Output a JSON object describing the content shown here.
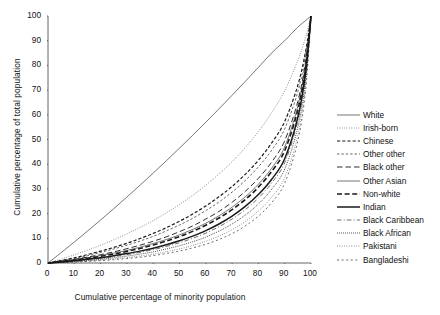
{
  "chart_data": {
    "type": "line",
    "title": "",
    "xlabel": "Cumulative percentage of minority population",
    "ylabel": "Cumulative percentage of total population",
    "xlim": [
      0,
      100
    ],
    "ylim": [
      0,
      100
    ],
    "xticks": [
      0,
      10,
      20,
      30,
      40,
      50,
      60,
      70,
      80,
      90,
      100
    ],
    "yticks": [
      0,
      10,
      20,
      30,
      40,
      50,
      60,
      70,
      80,
      90,
      100
    ],
    "grid": false,
    "legend_position": "right",
    "x": [
      0,
      5,
      10,
      15,
      20,
      25,
      30,
      35,
      40,
      45,
      50,
      55,
      60,
      65,
      70,
      75,
      80,
      85,
      90,
      95,
      98,
      100
    ],
    "series": [
      {
        "name": "White",
        "style": "solid-thin",
        "values": [
          0,
          4.2,
          8.5,
          12.9,
          17.4,
          22.0,
          26.7,
          31.5,
          36.4,
          41.4,
          46.5,
          51.7,
          57.0,
          62.4,
          67.9,
          73.5,
          79.2,
          85.0,
          90.0,
          95.5,
          98.2,
          100
        ]
      },
      {
        "name": "Irish-born",
        "style": "dotted-fine",
        "values": [
          0,
          1.6,
          3.3,
          5.2,
          7.2,
          9.4,
          11.8,
          14.4,
          17.2,
          20.3,
          23.7,
          27.4,
          31.5,
          36.0,
          41.0,
          46.7,
          53.2,
          60.8,
          69.8,
          82.0,
          91.5,
          100
        ]
      },
      {
        "name": "Chinese",
        "style": "dashed-med",
        "values": [
          0,
          1.0,
          2.1,
          3.4,
          4.8,
          6.3,
          8.0,
          9.9,
          12.0,
          14.3,
          16.9,
          19.8,
          23.1,
          26.8,
          31.0,
          35.9,
          41.6,
          48.5,
          57.3,
          72.0,
          86.0,
          100
        ]
      },
      {
        "name": "Other other",
        "style": "dashed-fine",
        "values": [
          0,
          0.9,
          1.9,
          3.0,
          4.3,
          5.7,
          7.2,
          8.9,
          10.8,
          13.0,
          15.4,
          18.1,
          21.2,
          24.7,
          28.7,
          33.4,
          38.9,
          45.6,
          54.3,
          69.4,
          84.5,
          100
        ]
      },
      {
        "name": "Black other",
        "style": "dashdash-long",
        "values": [
          0,
          0.7,
          1.5,
          2.4,
          3.4,
          4.5,
          5.8,
          7.2,
          8.8,
          10.6,
          12.7,
          15.0,
          17.8,
          20.9,
          24.6,
          29.0,
          34.3,
          40.8,
          49.5,
          65.5,
          82.0,
          100
        ]
      },
      {
        "name": "Other Asian",
        "style": "solid-thin",
        "values": [
          0,
          0.6,
          1.3,
          2.1,
          3.0,
          4.0,
          5.1,
          6.4,
          7.9,
          9.5,
          11.4,
          13.6,
          16.1,
          19.1,
          22.6,
          26.8,
          31.9,
          38.3,
          47.0,
          63.5,
          80.5,
          100
        ]
      },
      {
        "name": "Non-white",
        "style": "dashed-bold",
        "values": [
          0,
          0.55,
          1.2,
          1.9,
          2.7,
          3.6,
          4.7,
          5.9,
          7.3,
          8.9,
          10.7,
          12.8,
          15.3,
          18.2,
          21.6,
          25.7,
          30.7,
          37.0,
          45.5,
          62.0,
          79.5,
          100
        ]
      },
      {
        "name": "Indian",
        "style": "solid-bold",
        "values": [
          0,
          0.4,
          0.9,
          1.5,
          2.1,
          2.9,
          3.8,
          4.8,
          6.0,
          7.4,
          9.0,
          10.9,
          13.1,
          15.8,
          19.0,
          22.9,
          27.7,
          33.8,
          42.2,
          59.0,
          77.5,
          100
        ]
      },
      {
        "name": "Black Caribbean",
        "style": "dashdot-fine",
        "values": [
          0,
          0.35,
          0.8,
          1.3,
          1.9,
          2.6,
          3.4,
          4.3,
          5.4,
          6.7,
          8.2,
          10.0,
          12.1,
          14.7,
          17.8,
          21.6,
          26.3,
          32.3,
          40.6,
          57.5,
          76.5,
          100
        ]
      },
      {
        "name": "Black African",
        "style": "dotted-dense",
        "values": [
          0,
          0.3,
          0.65,
          1.05,
          1.5,
          2.1,
          2.8,
          3.6,
          4.5,
          5.7,
          7.0,
          8.6,
          10.5,
          12.9,
          15.8,
          19.4,
          23.9,
          29.8,
          38.0,
          55.0,
          74.5,
          100
        ]
      },
      {
        "name": "Pakistani",
        "style": "dotted-fine",
        "values": [
          0,
          0.22,
          0.5,
          0.82,
          1.2,
          1.65,
          2.2,
          2.85,
          3.6,
          4.6,
          5.7,
          7.1,
          8.8,
          10.9,
          13.5,
          16.8,
          21.0,
          26.6,
          34.6,
          51.8,
          72.5,
          100
        ]
      },
      {
        "name": "Bangladeshi",
        "style": "dashed-sparse",
        "values": [
          0,
          0.18,
          0.4,
          0.66,
          0.97,
          1.34,
          1.8,
          2.35,
          3.0,
          3.85,
          4.85,
          6.1,
          7.6,
          9.5,
          11.9,
          15.0,
          19.0,
          24.4,
          32.3,
          49.5,
          70.5,
          100
        ]
      }
    ]
  },
  "legend": {
    "items": [
      {
        "label": "White"
      },
      {
        "label": "Irish-born"
      },
      {
        "label": "Chinese"
      },
      {
        "label": "Other other"
      },
      {
        "label": "Black other"
      },
      {
        "label": "Other Asian"
      },
      {
        "label": "Non-white"
      },
      {
        "label": "Indian"
      },
      {
        "label": "Black Caribbean"
      },
      {
        "label": "Black African"
      },
      {
        "label": "Pakistani"
      },
      {
        "label": "Bangladeshi"
      }
    ]
  },
  "colors": {
    "line": "#1a1a1a",
    "axis": "#555555",
    "text": "#111111",
    "background": "#ffffff"
  }
}
